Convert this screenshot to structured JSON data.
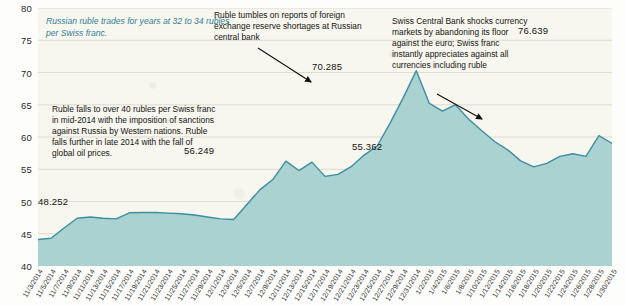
{
  "chart_data": {
    "type": "area",
    "xlabel": "",
    "ylabel": "",
    "ylim": [
      40,
      80
    ],
    "grid": true,
    "legend_position": "none",
    "series_name": "Rubles per Swiss franc",
    "line_color": "#3d8ea1",
    "fill_color": "#a9d2d0",
    "plot_background": "#f7f6ef",
    "accent_text_color": "#2f7f93",
    "y_ticks": [
      80,
      75,
      70,
      65,
      60,
      55,
      50,
      45,
      40
    ],
    "categories": [
      "11/3/2014",
      "11/5/2014",
      "11/7/2014",
      "11/9/2014",
      "11/11/2014",
      "11/13/2014",
      "11/15/2014",
      "11/17/2014",
      "11/19/2014",
      "11/21/2014",
      "11/23/2014",
      "11/25/2014",
      "11/27/2014",
      "11/29/2014",
      "12/1/2014",
      "12/3/2014",
      "12/5/2014",
      "12/7/2014",
      "12/9/2014",
      "12/11/2014",
      "12/13/2014",
      "12/15/2014",
      "12/17/2014",
      "12/19/2014",
      "12/21/2014",
      "12/23/2014",
      "12/25/2014",
      "12/27/2014",
      "12/29/2014",
      "12/31/2014",
      "1/2/2015",
      "1/4/2015",
      "1/6/2015",
      "1/8/2015",
      "1/10/2015",
      "1/12/2015",
      "1/14/2015",
      "1/16/2015",
      "1/18/2015",
      "1/20/2015",
      "1/22/2015",
      "1/24/2015",
      "1/26/2015",
      "1/28/2015",
      "1/30/2015"
    ],
    "values": [
      44.1,
      44.3,
      45.9,
      47.4,
      47.6,
      47.4,
      47.3,
      48.252,
      48.3,
      48.3,
      48.2,
      48.1,
      47.9,
      47.6,
      47.3,
      47.2,
      49.5,
      51.8,
      53.4,
      56.249,
      54.8,
      56.1,
      53.9,
      54.2,
      55.4,
      57.2,
      58.6,
      62.2,
      66.1,
      70.285,
      65.2,
      64.0,
      65.0,
      62.8,
      61.0,
      59.3,
      58.0,
      56.3,
      55.362,
      55.9,
      57.0,
      57.4,
      57.0,
      60.2,
      59.0
    ],
    "point_labels": [
      {
        "value": "48.252",
        "category": "11/17/2014"
      },
      {
        "value": "56.249",
        "category": "12/11/2014"
      },
      {
        "value": "70.285",
        "category": "12/17/2014"
      },
      {
        "value": "55.362",
        "category": "1/12/2015"
      },
      {
        "value": "76.639",
        "category": "1/22/2015"
      }
    ],
    "annotations": [
      {
        "id": "intro",
        "text": "Russian ruble trades for years at 32 to 34 rubles per Swiss franc.",
        "style": "italic-teal",
        "has_arrow": false
      },
      {
        "id": "sanctions",
        "text": "Ruble falls to over 40 rubles per Swiss franc in mid-2014 with the imposition of sanctions against Russia by Western nations. Ruble falls further in late 2014 with the fall of global oil prices.",
        "style": "plain",
        "has_arrow": false
      },
      {
        "id": "tumbles",
        "text": "Ruble tumbles on reports of foreign exchange reserve shortages at Russian central bank",
        "style": "plain",
        "has_arrow": true
      },
      {
        "id": "swiss",
        "text": "Swiss Central Bank shocks currency markets by abandoning its floor against the euro; Swiss franc instantly appreciates against all currencies including ruble",
        "style": "plain",
        "has_arrow": true
      }
    ]
  }
}
